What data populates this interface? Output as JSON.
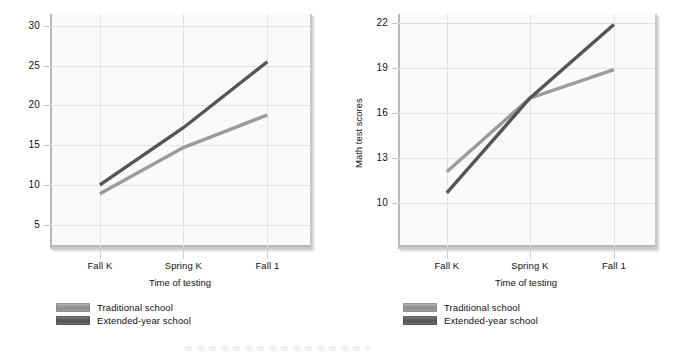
{
  "figure": {
    "background_color": "#ffffff",
    "plot_background_color": "#fafafa",
    "grid_color": "#e2e2e2",
    "traditional_color": "#9b9b9b",
    "extended_color": "#555555"
  },
  "legend": {
    "traditional_label": "Traditional school",
    "extended_label": "Extended-year school"
  },
  "chart_data": [
    {
      "type": "line",
      "panel": "left",
      "title": "",
      "xlabel": "Time of testing",
      "ylabel": "",
      "categories": [
        "Fall K",
        "Spring K",
        "Fall 1"
      ],
      "yticks": [
        5,
        10,
        15,
        20,
        25,
        30
      ],
      "ylim": [
        2.2,
        31.5
      ],
      "grid": true,
      "legend_position": "below-axes",
      "series": [
        {
          "name": "Traditional school",
          "color": "#9b9b9b",
          "values": [
            8.9,
            14.7,
            18.8
          ]
        },
        {
          "name": "Extended-year school",
          "color": "#555555",
          "values": [
            10.0,
            17.2,
            25.5
          ]
        }
      ]
    },
    {
      "type": "line",
      "panel": "right",
      "title": "",
      "xlabel": "Time of testing",
      "ylabel": "Math test scores",
      "categories": [
        "Fall K",
        "Spring K",
        "Fall 1"
      ],
      "yticks": [
        10,
        13,
        16,
        19,
        22
      ],
      "ylim": [
        7.1,
        22.6
      ],
      "grid": true,
      "legend_position": "below-axes",
      "series": [
        {
          "name": "Traditional school",
          "color": "#9b9b9b",
          "values": [
            12.1,
            17.0,
            18.9
          ]
        },
        {
          "name": "Extended-year school",
          "color": "#555555",
          "values": [
            10.7,
            17.0,
            21.9
          ]
        }
      ]
    }
  ]
}
